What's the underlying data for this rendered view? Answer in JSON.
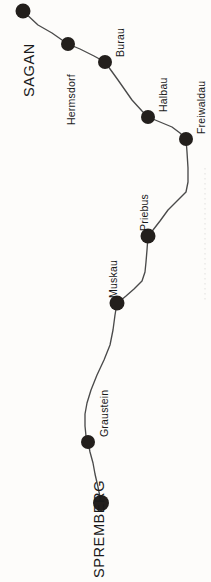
{
  "map": {
    "title": "Sagan - Spremberg route",
    "background_color": "#fdfcfa",
    "line_color": "#4a4a4a",
    "node_color": "#231f1c",
    "label_color": "#1a1a1a",
    "width": 211,
    "height": 582,
    "line_style": "solid thin polyline",
    "label_orientation": "rotated 90 degrees counter-clockwise"
  },
  "stations": [
    {
      "name": "SAGAN",
      "kind": "terminus",
      "x": 23,
      "y": 11,
      "label_x": 22,
      "label_y": 97,
      "radius": 7.5
    },
    {
      "name": "Hermsdorf",
      "kind": "stop",
      "x": 68,
      "y": 44,
      "label_x": 66,
      "label_y": 125,
      "radius": 7.0
    },
    {
      "name": "Burau",
      "kind": "stop",
      "x": 105,
      "y": 62,
      "label_x": 115,
      "label_y": 57,
      "radius": 7.0
    },
    {
      "name": "Halbau",
      "kind": "stop",
      "x": 148,
      "y": 117,
      "label_x": 158,
      "label_y": 112,
      "radius": 7.0
    },
    {
      "name": "Freiwaldau",
      "kind": "stop",
      "x": 186,
      "y": 139,
      "label_x": 196,
      "label_y": 134,
      "radius": 7.0
    },
    {
      "name": "Priebus",
      "kind": "stop",
      "x": 148,
      "y": 236,
      "label_x": 139,
      "label_y": 231,
      "radius": 7.5
    },
    {
      "name": "Muskau",
      "kind": "stop",
      "x": 117,
      "y": 303,
      "label_x": 108,
      "label_y": 298,
      "radius": 7.5
    },
    {
      "name": "Graustein",
      "kind": "stop",
      "x": 88,
      "y": 442,
      "label_x": 99,
      "label_y": 437,
      "radius": 7.0
    },
    {
      "name": "SPREMBERG",
      "kind": "terminus",
      "x": 101,
      "y": 503,
      "label_x": 92,
      "label_y": 578,
      "radius": 8.0
    }
  ],
  "route_path": "M 23 11 L 38 25 L 52 33 L 62 40 L 68 44 L 80 49 L 94 56 L 105 62 L 118 80 L 132 100 L 142 111 L 148 117 L 160 122 L 172 127 L 180 133 L 186 139 L 187 152 L 188 168 L 188 182 L 186 192 L 178 200 L 168 210 L 160 221 L 153 230 L 148 236 L 147 250 L 146 262 L 145 272 L 142 281 L 134 289 L 126 296 L 120 301 L 117 303 L 115 315 L 113 330 L 110 345 L 104 360 L 97 375 L 91 390 L 87 403 L 85 414 L 85 426 L 86 436 L 88 442 L 90 452 L 93 463 L 95 474 L 98 487 L 100 497 L 101 503",
  "side_marks": {
    "present": true,
    "description": "faint dotted vertical rule at right edge"
  }
}
